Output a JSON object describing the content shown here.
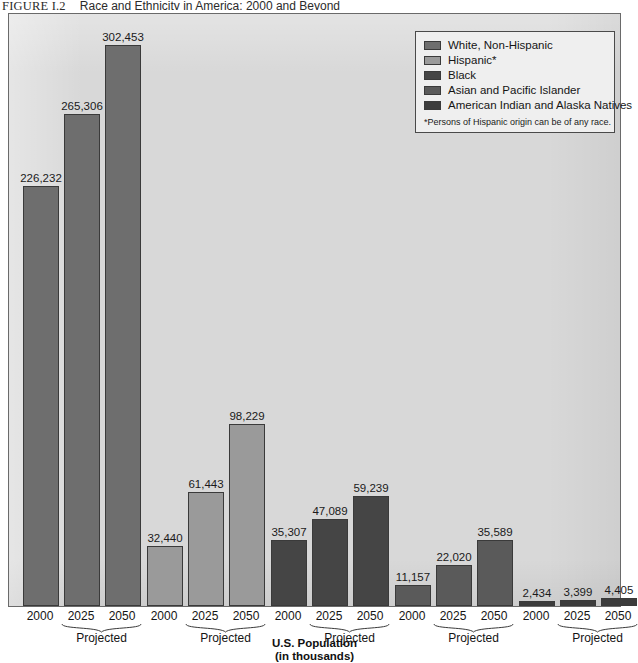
{
  "figure": {
    "label": "FIGURE I.2",
    "title": "Race and Ethnicity in America: 2000 and Beyond"
  },
  "legend": {
    "footnote": "*Persons of Hispanic origin can be of any race.",
    "items": [
      {
        "label": "White, Non-Hispanic",
        "color": "#6e6e6e"
      },
      {
        "label": "Hispanic*",
        "color": "#9a9a9a"
      },
      {
        "label": "Black",
        "color": "#454545"
      },
      {
        "label": "Asian and Pacific Islander",
        "color": "#5a5a5a"
      },
      {
        "label": "American Indian and Alaska Natives",
        "color": "#3c3c3c"
      }
    ]
  },
  "axis": {
    "title_line1": "U.S. Population",
    "title_line2": "(in thousands)",
    "projected_label": "Projected",
    "years": [
      "2000",
      "2025",
      "2050"
    ]
  },
  "chart_data": {
    "type": "bar",
    "title": "Race and Ethnicity in America: 2000 and Beyond",
    "xlabel": "U.S. Population (in thousands)",
    "ylabel": "",
    "ylim": [
      0,
      320000
    ],
    "grid": false,
    "legend_position": "top-right",
    "categories": [
      "2000",
      "2025",
      "2050"
    ],
    "units": "thousands",
    "note": "2025 and 2050 values are projected",
    "series": [
      {
        "name": "White, Non-Hispanic",
        "color": "#6e6e6e",
        "values": [
          226232,
          265306,
          302453
        ],
        "labels": [
          "226,232",
          "265,306",
          "302,453"
        ]
      },
      {
        "name": "Hispanic*",
        "color": "#9a9a9a",
        "values": [
          32440,
          61443,
          98229
        ],
        "labels": [
          "32,440",
          "61,443",
          "98,229"
        ]
      },
      {
        "name": "Black",
        "color": "#454545",
        "values": [
          35307,
          47089,
          59239
        ],
        "labels": [
          "35,307",
          "47,089",
          "59,239"
        ]
      },
      {
        "name": "Asian and Pacific Islander",
        "color": "#5a5a5a",
        "values": [
          11157,
          22020,
          35589
        ],
        "labels": [
          "11,157",
          "22,020",
          "35,589"
        ]
      },
      {
        "name": "American Indian and Alaska Natives",
        "color": "#3c3c3c",
        "values": [
          2434,
          3399,
          4405
        ],
        "labels": [
          "2,434",
          "3,399",
          "4,405"
        ]
      }
    ]
  },
  "layout": {
    "plot_height_px": 594,
    "value_max": 320000,
    "bar_width_px": 36,
    "group_starts_px": [
      14,
      138,
      262,
      386,
      510
    ],
    "bar_pitch_px": 41
  }
}
